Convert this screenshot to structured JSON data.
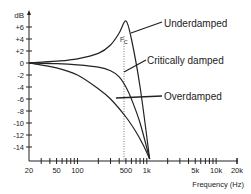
{
  "chart_data": {
    "type": "line",
    "title": "",
    "xlabel": "Frequency (Hz)",
    "ylabel": "dB",
    "x_scale": "log",
    "xlim": [
      20,
      20000
    ],
    "ylim": [
      -16,
      8
    ],
    "grid": false,
    "x_ticks": [
      "20",
      "50",
      "100",
      "500",
      "1k",
      "5k",
      "10k",
      "20k"
    ],
    "y_ticks": [
      "+6",
      "+4",
      "+2",
      "0",
      "-2",
      "-4",
      "-6",
      "-8",
      "-10",
      "-12",
      "-14"
    ],
    "annotation": {
      "label": "Fc",
      "x": 500,
      "style": "dotted vertical line"
    },
    "series": [
      {
        "name": "Underdamped",
        "x": [
          20,
          50,
          100,
          200,
          300,
          400,
          500,
          600,
          800,
          1100
        ],
        "y": [
          0,
          0.3,
          0.7,
          1.6,
          3,
          5,
          7,
          4,
          -4,
          -16
        ]
      },
      {
        "name": "Critically damped",
        "x": [
          20,
          50,
          100,
          200,
          300,
          400,
          500,
          600,
          800,
          1100
        ],
        "y": [
          0,
          -0.1,
          -0.3,
          -0.7,
          -1.3,
          -2.3,
          -4,
          -6,
          -10,
          -16
        ]
      },
      {
        "name": "Overdamped",
        "x": [
          20,
          50,
          100,
          200,
          300,
          500,
          700,
          900,
          1100
        ],
        "y": [
          0,
          -0.8,
          -2,
          -4.3,
          -6,
          -9,
          -11.5,
          -13.8,
          -16
        ]
      }
    ],
    "legend": "inline labels with leader lines, right side"
  },
  "labels": {
    "y_unit": "dB",
    "x_title": "Frequency (Hz)",
    "fc": "F",
    "fc_sub": "C",
    "underdamped": "Underdamped",
    "critically": "Critically damped",
    "overdamped": "Overdamped"
  }
}
